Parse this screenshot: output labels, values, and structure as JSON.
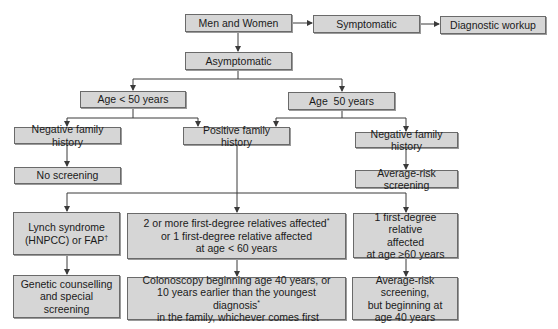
{
  "diagram": {
    "type": "flowchart",
    "topic": "Colorectal cancer screening algorithm",
    "nodes": {
      "root": "Men and Women",
      "symptomatic": "Symptomatic",
      "diagnostic": "Diagnostic workup",
      "asymptomatic": "Asymptomatic",
      "age_lt50": "Age < 50 years",
      "age_ge50": "Age  50 years",
      "neg_left": "Negative family history",
      "positive": "Positive family history",
      "neg_right": "Negative family history",
      "no_screening": "No screening",
      "avg_risk": "Average-risk screening",
      "lynch": {
        "line1": "Lynch syndrome",
        "line2": "(HNPCC) or FAP",
        "mark": "†"
      },
      "two_or_more": {
        "line1": "2 or more first-degree relatives affected",
        "mark": "*",
        "line2": "or 1 first-degree relative affected",
        "line3": "at age < 60 years"
      },
      "one_first": {
        "line1": "1 first-degree relative",
        "line2": "affected",
        "line3": "at age ≥60 years"
      },
      "genetic": {
        "line1": "Genetic counselling",
        "line2": "and special screening"
      },
      "colonoscopy": {
        "line1": "Colonoscopy beginning age 40 years, or",
        "line2": "10 years earlier than the youngest",
        "line3a": "diagnosis",
        "mark": "*",
        "line3b": " in the family, whichever comes first"
      },
      "avg_40": {
        "line1": "Average-risk screening,",
        "line2": "but beginning at",
        "line3": "age 40 years"
      }
    },
    "edges": [
      [
        "root",
        "symptomatic"
      ],
      [
        "symptomatic",
        "diagnostic"
      ],
      [
        "root",
        "asymptomatic"
      ],
      [
        "asymptomatic",
        "age_lt50"
      ],
      [
        "asymptomatic",
        "age_ge50"
      ],
      [
        "age_lt50",
        "neg_left"
      ],
      [
        "age_lt50",
        "positive"
      ],
      [
        "age_ge50",
        "positive"
      ],
      [
        "age_ge50",
        "neg_right"
      ],
      [
        "neg_left",
        "no_screening"
      ],
      [
        "neg_right",
        "avg_risk"
      ],
      [
        "positive",
        "lynch"
      ],
      [
        "positive",
        "two_or_more"
      ],
      [
        "positive",
        "one_first"
      ],
      [
        "lynch",
        "genetic"
      ],
      [
        "two_or_more",
        "colonoscopy"
      ],
      [
        "one_first",
        "avg_40"
      ]
    ],
    "colors": {
      "box_fill": "#d6d6d6",
      "box_border": "#6a6a6a",
      "line": "#3a3a3a",
      "background": "#ffffff"
    }
  }
}
